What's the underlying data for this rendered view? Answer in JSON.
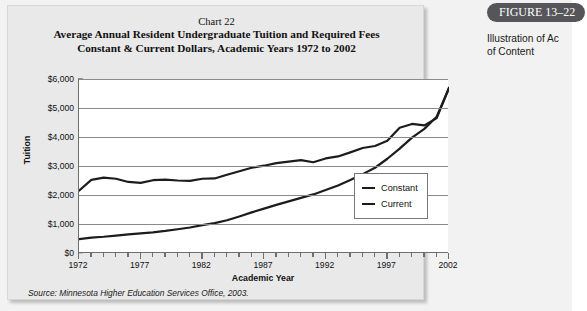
{
  "figure_panel": {
    "banner_label": "FIGURE 13–22",
    "caption_line_1": "Illustration of Ac",
    "caption_line_2": "of Content",
    "banner_color": "#55555a"
  },
  "card": {
    "background_color": "#e9e9e9",
    "source_note": "Source: Minnesota Higher Education Services Office, 2003."
  },
  "chart_data": {
    "type": "line",
    "chart_number": "Chart 22",
    "title_line_1": "Average Annual Resident Undergraduate Tuition and Required Fees",
    "title_line_2": "Constant & Current Dollars, Academic Years 1972 to 2002",
    "xlabel": "Academic Year",
    "ylabel": "Tuition",
    "xlim": [
      1972,
      2002
    ],
    "ylim": [
      0,
      6000
    ],
    "ytick_values": [
      0,
      1000,
      2000,
      3000,
      4000,
      5000,
      6000
    ],
    "ytick_labels": [
      "$0",
      "$1,000",
      "$2,000",
      "$3,000",
      "$4,000",
      "$5,000",
      "$6,000"
    ],
    "xtick_labels": [
      "1972",
      "1977",
      "1982",
      "1987",
      "1992",
      "1997",
      "2002"
    ],
    "xtick_values": [
      1972,
      1977,
      1982,
      1987,
      1992,
      1997,
      2002
    ],
    "xtick_interval": 1,
    "grid": "horizontal",
    "legend_position": "inside-right",
    "line_color": "#1c1c1c",
    "x": [
      1972,
      1973,
      1974,
      1975,
      1976,
      1977,
      1978,
      1979,
      1980,
      1981,
      1982,
      1983,
      1984,
      1985,
      1986,
      1987,
      1988,
      1989,
      1990,
      1991,
      1992,
      1993,
      1994,
      1995,
      1996,
      1997,
      1998,
      1999,
      2000,
      2001,
      2002
    ],
    "series": [
      {
        "name": "Constant",
        "values": [
          2150,
          2520,
          2600,
          2560,
          2450,
          2420,
          2510,
          2530,
          2500,
          2490,
          2560,
          2570,
          2700,
          2820,
          2940,
          3010,
          3100,
          3150,
          3200,
          3130,
          3260,
          3330,
          3470,
          3620,
          3690,
          3870,
          4320,
          4450,
          4400,
          4650,
          5700
        ]
      },
      {
        "name": "Current",
        "values": [
          480,
          530,
          560,
          600,
          640,
          680,
          710,
          760,
          820,
          880,
          960,
          1030,
          1130,
          1260,
          1400,
          1530,
          1660,
          1780,
          1900,
          2020,
          2170,
          2330,
          2520,
          2720,
          2940,
          3250,
          3600,
          3980,
          4280,
          4700,
          5680
        ]
      }
    ]
  }
}
